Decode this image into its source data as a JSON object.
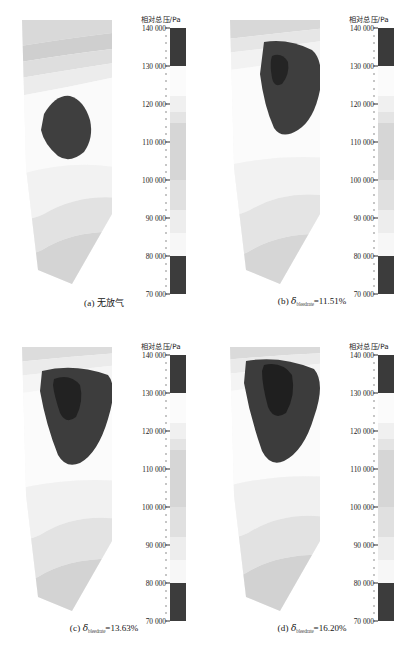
{
  "figure": {
    "colorbar_title": "相对总压/Pa",
    "tick_labels": [
      "140 000",
      "130 000",
      "120 000",
      "110 000",
      "100 000",
      "90 000",
      "80 000",
      "70 000"
    ]
  },
  "panels": [
    {
      "id": "a",
      "caption_label": "(a)",
      "caption_text": "无放气",
      "caption_type": "cn",
      "symbol": "",
      "subscript": "",
      "value": ""
    },
    {
      "id": "b",
      "caption_label": "(b)",
      "caption_text": "",
      "caption_type": "formula",
      "symbol": "δ",
      "subscript": "bleedrate",
      "value": "=11.51%"
    },
    {
      "id": "c",
      "caption_label": "(c)",
      "caption_text": "",
      "caption_type": "formula",
      "symbol": "δ",
      "subscript": "bleedrate",
      "value": "=13.63%"
    },
    {
      "id": "d",
      "caption_label": "(d)",
      "caption_text": "",
      "caption_type": "formula",
      "symbol": "δ",
      "subscript": "bleedrate",
      "value": "=16.20%"
    }
  ],
  "chart_data": {
    "type": "heatmap",
    "title": "相对总压/Pa",
    "subtitle": "",
    "xlabel": "",
    "ylabel": "相对总压/Pa",
    "colorbar": {
      "label": "相对总压/Pa",
      "units": "Pa",
      "vmin": 70000,
      "vmax": 140000,
      "tick_values": [
        140000,
        130000,
        120000,
        110000,
        100000,
        90000,
        80000,
        70000
      ],
      "tick_labels": [
        "140 000",
        "130 000",
        "120 000",
        "110 000",
        "100 000",
        "90 000",
        "80 000",
        "70 000"
      ],
      "orientation": "vertical",
      "position": "right",
      "colormap": "grayscale-banded",
      "bands": [
        {
          "range": [
            130000,
            140000
          ],
          "color": "#3a3a3a"
        },
        {
          "range": [
            122000,
            130000
          ],
          "color": "#fbfbfb"
        },
        {
          "range": [
            118000,
            122000
          ],
          "color": "#f0f0f0"
        },
        {
          "range": [
            115000,
            118000
          ],
          "color": "#e4e4e4"
        },
        {
          "range": [
            100000,
            115000
          ],
          "color": "#d6d6d6"
        },
        {
          "range": [
            92000,
            100000
          ],
          "color": "#e0e0e0"
        },
        {
          "range": [
            86000,
            92000
          ],
          "color": "#ededed"
        },
        {
          "range": [
            80000,
            86000
          ],
          "color": "#f7f7f7"
        },
        {
          "range": [
            70000,
            80000
          ],
          "color": "#3c3c3c"
        }
      ]
    },
    "grid": false,
    "legend_position": "right",
    "axis_ranges": {
      "colorbar": [
        70000,
        140000
      ]
    },
    "panels": [
      {
        "id": "a",
        "caption": "(a) 无放气",
        "bleed_rate_percent": null,
        "description": "blade passage relative total pressure contour, no bleed",
        "high_pressure_core_area_fraction": 0.09,
        "core_centroid_xy": [
          0.42,
          0.33
        ]
      },
      {
        "id": "b",
        "caption": "(b) δbleedrate =11.51%",
        "bleed_rate_percent": 11.51,
        "description": "blade passage relative total pressure contour, bleed 11.51%",
        "high_pressure_core_area_fraction": 0.2,
        "core_centroid_xy": [
          0.55,
          0.26
        ]
      },
      {
        "id": "c",
        "caption": "(c) δbleedrate =13.63%",
        "bleed_rate_percent": 13.63,
        "description": "blade passage relative total pressure contour, bleed 13.63%",
        "high_pressure_core_area_fraction": 0.24,
        "core_centroid_xy": [
          0.53,
          0.24
        ]
      },
      {
        "id": "d",
        "caption": "(d) δbleedrate =16.20%",
        "bleed_rate_percent": 16.2,
        "description": "blade passage relative total pressure contour, bleed 16.20%",
        "high_pressure_core_area_fraction": 0.25,
        "core_centroid_xy": [
          0.5,
          0.22
        ]
      }
    ]
  }
}
